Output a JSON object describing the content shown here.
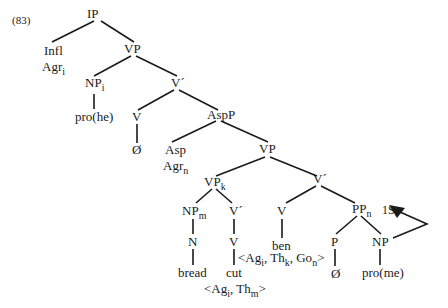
{
  "example_number": "(83)",
  "nodes": {
    "ip": {
      "label": "IP"
    },
    "infl": {
      "label": "Infl"
    },
    "agr_i": {
      "label": "Agr",
      "sub": "i"
    },
    "vp1": {
      "label": "VP"
    },
    "np_i": {
      "label": "NP",
      "sub": "i"
    },
    "pro_he": {
      "label": "pro(he)"
    },
    "vbar1": {
      "label": "V´"
    },
    "v1": {
      "label": "V"
    },
    "null1": {
      "label": "Ø"
    },
    "aspp": {
      "label": "AspP"
    },
    "asp": {
      "label": "Asp"
    },
    "agr_n": {
      "label": "Agr",
      "sub": "n"
    },
    "vp2": {
      "label": "VP"
    },
    "vp_k": {
      "label": "VP",
      "sub": "k"
    },
    "vbar2": {
      "label": "V´"
    },
    "np_m": {
      "label": "NP",
      "sub": "m"
    },
    "n": {
      "label": "N"
    },
    "bread": {
      "label": "bread"
    },
    "vbar3": {
      "label": "V´"
    },
    "v2": {
      "label": "V"
    },
    "cut": {
      "label": "cut"
    },
    "cut_grid": {
      "parts": [
        "<Ag",
        "i",
        ", Th",
        "m",
        ">"
      ]
    },
    "v3": {
      "label": "V"
    },
    "ben": {
      "label": "ben"
    },
    "ben_grid": {
      "parts": [
        "<Ag",
        "i",
        ", Th",
        "k",
        ", Go",
        "n",
        ">"
      ]
    },
    "pp_n": {
      "label": "PP",
      "sub": "n"
    },
    "p": {
      "label": "P"
    },
    "null2": {
      "label": "Ø"
    },
    "np": {
      "label": "NP"
    },
    "pro_me": {
      "label": "pro(me)"
    },
    "one_s": {
      "label": "1S"
    }
  },
  "colors": {
    "line": "#1a1a1a",
    "text": "#1a1a1a",
    "background": "#ffffff"
  }
}
